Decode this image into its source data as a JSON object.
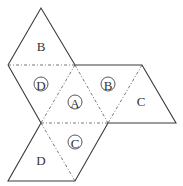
{
  "diagram": {
    "faces": [
      {
        "id": "top-B",
        "label": "B",
        "circled": false
      },
      {
        "id": "D-circled",
        "label": "D",
        "circled": true
      },
      {
        "id": "A-circled",
        "label": "A",
        "circled": true
      },
      {
        "id": "B-circled",
        "label": "B",
        "circled": true
      },
      {
        "id": "right-C",
        "label": "C",
        "circled": false
      },
      {
        "id": "C-circled",
        "label": "C",
        "circled": true
      },
      {
        "id": "bottom-D",
        "label": "D",
        "circled": false
      }
    ]
  }
}
